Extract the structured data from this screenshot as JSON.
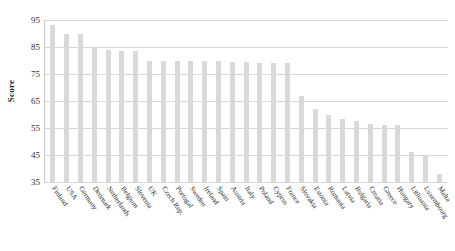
{
  "chart_data": {
    "type": "bar",
    "title": "",
    "xlabel": "",
    "ylabel": "Score",
    "ylim": [
      35,
      95
    ],
    "yticks": [
      35,
      45,
      55,
      65,
      75,
      85,
      95
    ],
    "grid": true,
    "legend": false,
    "bar_color": "#d9d9d9",
    "categories": [
      "Finland",
      "USA",
      "Germany",
      "Denmark",
      "Netherlands",
      "Belgium",
      "Slovenia",
      "UK",
      "Czech Rep.",
      "Portugal",
      "Sweden",
      "Ireland",
      "Spain",
      "Austria",
      "Italy",
      "Poland",
      "Cyprus",
      "France",
      "Slovakia",
      "Estonia",
      "Romania",
      "Latvia",
      "Bulgaria",
      "Croatia",
      "Greece",
      "Hungary",
      "Lithuania",
      "Luxembourg",
      "Malta"
    ],
    "values": [
      93,
      90,
      90,
      85,
      84,
      83.5,
      83.5,
      80,
      80,
      80,
      80,
      80,
      80,
      79.5,
      79.5,
      79,
      79,
      79,
      67,
      62,
      60,
      58.5,
      57.5,
      56.5,
      56,
      56,
      46,
      45,
      38
    ]
  },
  "axis": {
    "y_title": "Score"
  }
}
